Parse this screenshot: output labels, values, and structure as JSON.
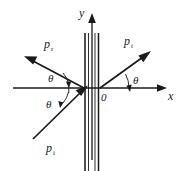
{
  "figure": {
    "type": "physics-ray-diagram",
    "background_color": "#ffffff",
    "ink_color": "#1a1a1a"
  },
  "axes": {
    "y_label": "y",
    "x_label": "x",
    "origin_label": "0"
  },
  "rays": [
    {
      "id": "reflected",
      "label_base": "p",
      "label_sub": "r",
      "direction": "up-left",
      "arrow": "outgoing"
    },
    {
      "id": "transmitted",
      "label_base": "p",
      "label_sub": "t",
      "direction": "up-right",
      "arrow": "outgoing"
    },
    {
      "id": "incident",
      "label_base": "p",
      "label_sub": "i",
      "direction": "up-right-toward-origin",
      "arrow": "incoming"
    }
  ],
  "angles": [
    {
      "id": "theta-reflected",
      "label": "θ"
    },
    {
      "id": "theta-incident",
      "label": "θ"
    },
    {
      "id": "theta-transmitted",
      "label": "θ"
    }
  ],
  "interface": {
    "name": "vertical-slab",
    "line_count": 4,
    "orientation": "vertical"
  }
}
